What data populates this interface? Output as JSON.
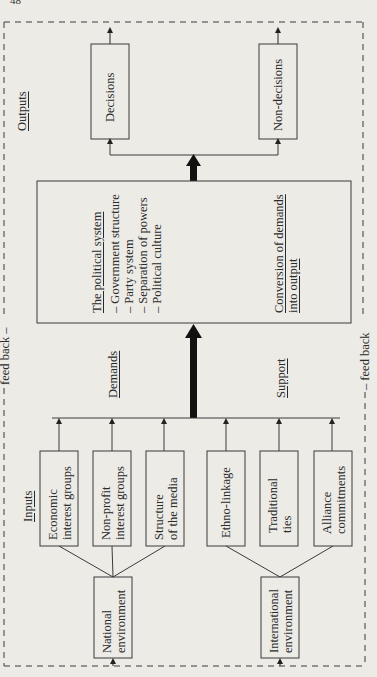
{
  "page_number": "48",
  "labels": {
    "outputs": "Outputs",
    "inputs": "Inputs",
    "demands": "Demands",
    "support": "Support",
    "feedback_left": "feed back –",
    "feedback_right": "– feed back"
  },
  "outputs": {
    "decisions": "Decisions",
    "non_decisions": "Non-decisions"
  },
  "political_system": {
    "title": "The political system",
    "items": [
      "Government structure",
      "Party system",
      "Separation of powers",
      "Political culture"
    ],
    "conversion_line1": "Conversion of demands",
    "conversion_line2": "into output"
  },
  "inputs": {
    "national": [
      {
        "line1": "Economic",
        "line2": "interest groups"
      },
      {
        "line1": "Non-profit",
        "line2": "interest groups"
      },
      {
        "line1": "Structure",
        "line2": "of the media"
      }
    ],
    "international": [
      {
        "line1": "Ethno-linkage",
        "line2": ""
      },
      {
        "line1": "Traditional",
        "line2": "ties"
      },
      {
        "line1": "Alliance",
        "line2": "commitments"
      }
    ]
  },
  "environments": {
    "national": {
      "line1": "National",
      "line2": "environment"
    },
    "international": {
      "line1": "International",
      "line2": "environment"
    }
  },
  "colors": {
    "background": "#ecebe6",
    "line": "#3a3a3a",
    "arrow": "#111111"
  }
}
